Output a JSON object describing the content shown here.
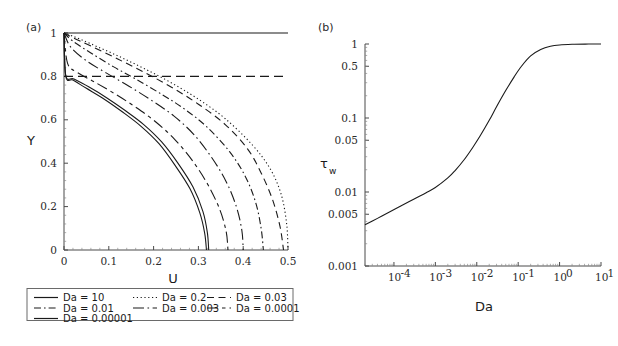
{
  "figure": {
    "panel_a_label": "(a)",
    "panel_b_label": "(b)"
  },
  "chart_data": [
    {
      "id": "panel_a",
      "type": "line",
      "title": "(a)",
      "xlabel": "U",
      "ylabel": "Y",
      "xscale": "linear",
      "yscale": "linear",
      "xlim": [
        0,
        0.5
      ],
      "ylim": [
        0,
        1
      ],
      "xticks": [
        0,
        0.1,
        0.2,
        0.3,
        0.4,
        0.5
      ],
      "xticklabels": [
        "0",
        "0.1",
        "0.2",
        "0.3",
        "0.4",
        "0.5"
      ],
      "yticks": [
        0,
        0.2,
        0.4,
        0.6,
        0.8,
        1
      ],
      "yticklabels": [
        "0",
        "0.2",
        "0.4",
        "0.6",
        "0.8",
        "1"
      ],
      "grid": false,
      "legend_position": "below-axes",
      "annotations": [
        {
          "text": "horizontal dashed reference line at Y = 0.8",
          "y": 0.8,
          "style": "dashed"
        }
      ],
      "series": [
        {
          "name": "Da = 10",
          "dash": "solid",
          "comment": "flat plug-flow profile at Y = 1 across full U range",
          "x": [
            0.0,
            0.05,
            0.1,
            0.15,
            0.2,
            0.25,
            0.3,
            0.35,
            0.4,
            0.45,
            0.5
          ],
          "y": [
            1.0,
            1.0,
            1.0,
            1.0,
            1.0,
            1.0,
            1.0,
            1.0,
            1.0,
            1.0,
            1.0
          ]
        },
        {
          "name": "Da = 0.2",
          "dash": "dotted",
          "x": [
            0.0,
            0.02,
            0.06,
            0.12,
            0.18,
            0.24,
            0.3,
            0.36,
            0.42,
            0.46,
            0.485,
            0.497,
            0.5
          ],
          "y": [
            1.0,
            0.985,
            0.95,
            0.895,
            0.835,
            0.77,
            0.695,
            0.605,
            0.485,
            0.375,
            0.255,
            0.12,
            0.0
          ]
        },
        {
          "name": "Da = 0.03",
          "dash": "dashed",
          "x": [
            0.0,
            0.02,
            0.06,
            0.12,
            0.18,
            0.24,
            0.3,
            0.36,
            0.41,
            0.44,
            0.465,
            0.482,
            0.49
          ],
          "y": [
            1.0,
            0.978,
            0.94,
            0.88,
            0.818,
            0.75,
            0.672,
            0.578,
            0.465,
            0.355,
            0.235,
            0.11,
            0.0
          ]
        },
        {
          "name": "Da = 0.01",
          "dash": "dashdot",
          "x": [
            0.0,
            0.02,
            0.06,
            0.11,
            0.16,
            0.22,
            0.27,
            0.32,
            0.37,
            0.405,
            0.428,
            0.44,
            0.445
          ],
          "y": [
            1.0,
            0.962,
            0.908,
            0.845,
            0.788,
            0.715,
            0.648,
            0.565,
            0.452,
            0.338,
            0.218,
            0.1,
            0.0
          ]
        },
        {
          "name": "Da = 0.003",
          "dash": "longdashdot",
          "x": [
            0.0,
            0.015,
            0.05,
            0.095,
            0.145,
            0.195,
            0.245,
            0.29,
            0.33,
            0.362,
            0.385,
            0.397,
            0.4
          ],
          "y": [
            1.0,
            0.935,
            0.872,
            0.815,
            0.755,
            0.69,
            0.618,
            0.532,
            0.425,
            0.315,
            0.198,
            0.09,
            0.0
          ]
        },
        {
          "name": "Da = 0.0001",
          "dash": "longdash-shortdash",
          "x": [
            0.0,
            0.008,
            0.03,
            0.07,
            0.115,
            0.16,
            0.205,
            0.248,
            0.288,
            0.322,
            0.348,
            0.362,
            0.366
          ],
          "y": [
            1.0,
            0.86,
            0.818,
            0.772,
            0.718,
            0.658,
            0.59,
            0.508,
            0.408,
            0.298,
            0.185,
            0.085,
            0.0
          ]
        },
        {
          "name": "Da = 0.00001",
          "dash": "solid",
          "x": [
            0.0,
            0.004,
            0.022,
            0.055,
            0.095,
            0.135,
            0.178,
            0.218,
            0.255,
            0.288,
            0.31,
            0.32,
            0.323
          ],
          "y": [
            1.0,
            0.805,
            0.788,
            0.752,
            0.702,
            0.645,
            0.578,
            0.498,
            0.398,
            0.29,
            0.178,
            0.08,
            0.0
          ]
        },
        {
          "name": "Da = 0.00001 (second branch)",
          "dash": "solid",
          "x": [
            0.0,
            0.004,
            0.02,
            0.05,
            0.09,
            0.13,
            0.172,
            0.212,
            0.248,
            0.281,
            0.303,
            0.314,
            0.318
          ],
          "y": [
            1.0,
            0.8,
            0.783,
            0.745,
            0.695,
            0.637,
            0.57,
            0.49,
            0.39,
            0.283,
            0.172,
            0.078,
            0.0
          ]
        }
      ]
    },
    {
      "id": "panel_b",
      "type": "line",
      "title": "(b)",
      "xlabel": "Da",
      "ylabel": "τw",
      "xscale": "log",
      "yscale": "log",
      "xlim": [
        2e-05,
        10
      ],
      "ylim": [
        0.001,
        1
      ],
      "xticks": [
        0.0001,
        0.001,
        0.01,
        0.1,
        1,
        10
      ],
      "xticklabels": [
        "10⁻⁴",
        "10⁻³",
        "10⁻²",
        "10⁻¹",
        "10⁰",
        "10¹"
      ],
      "yticks": [
        0.001,
        0.005,
        0.01,
        0.05,
        0.1,
        0.5,
        1
      ],
      "yticklabels": [
        "0.001",
        "0.005",
        "0.01",
        "0.05",
        "0.1",
        "0.5",
        "1"
      ],
      "grid": false,
      "legend_position": "none",
      "series": [
        {
          "name": "τw vs Da",
          "dash": "solid",
          "x": [
            2e-05,
            4e-05,
            8e-05,
            0.00015,
            0.0003,
            0.0006,
            0.001,
            0.002,
            0.003,
            0.005,
            0.008,
            0.012,
            0.02,
            0.03,
            0.05,
            0.08,
            0.12,
            0.2,
            0.35,
            0.6,
            1.0,
            2.0,
            5.0,
            10.0
          ],
          "y": [
            0.0036,
            0.0044,
            0.0054,
            0.0065,
            0.008,
            0.0098,
            0.0115,
            0.0155,
            0.0195,
            0.0275,
            0.04,
            0.057,
            0.093,
            0.142,
            0.235,
            0.36,
            0.5,
            0.69,
            0.84,
            0.93,
            0.97,
            0.99,
            0.998,
            1.0
          ]
        }
      ]
    }
  ],
  "panel_a": {
    "label": "(a)",
    "xlabel": "U",
    "ylabel": "Y",
    "xticklabels": [
      "0",
      "0.1",
      "0.2",
      "0.3",
      "0.4",
      "0.5"
    ],
    "yticklabels": [
      "0",
      "0.2",
      "0.4",
      "0.6",
      "0.8",
      "1"
    ]
  },
  "panel_b": {
    "label": "(b)",
    "xlabel": "Da",
    "ylabel_main": "τ",
    "ylabel_sub": "w",
    "xticklabels": [
      "10",
      "10",
      "10",
      "10",
      "10",
      "10"
    ],
    "xtick_exponents": [
      "-4",
      "-3",
      "-2",
      "-1",
      "0",
      "1"
    ],
    "yticklabels": [
      "0.001",
      "0.005",
      "0.01",
      "0.05",
      "0.1",
      "0.5",
      "1"
    ]
  },
  "legend": {
    "items": [
      {
        "label": "Da = 10",
        "dash": "solid",
        "col": 0,
        "row": 0
      },
      {
        "label": "Da = 0.2",
        "dash": "dotted",
        "col": 1,
        "row": 0
      },
      {
        "label": "Da = 0.03",
        "dash": "dashed",
        "col": 2,
        "row": 0
      },
      {
        "label": "Da = 0.01",
        "dash": "dashdot",
        "col": 0,
        "row": 1
      },
      {
        "label": "Da = 0.003",
        "dash": "longdashdot",
        "col": 1,
        "row": 1
      },
      {
        "label": "Da = 0.0001",
        "dash": "longdash-shortdash",
        "col": 2,
        "row": 1
      },
      {
        "label": "Da = 0.00001",
        "dash": "solid",
        "col": 0,
        "row": 2
      }
    ]
  },
  "colors": {
    "curve": "#1a1a1a",
    "axis": "#4a4a4a",
    "text": "#1a1a1a",
    "background": "#ffffff",
    "legend_border": "#6a6a6a"
  }
}
